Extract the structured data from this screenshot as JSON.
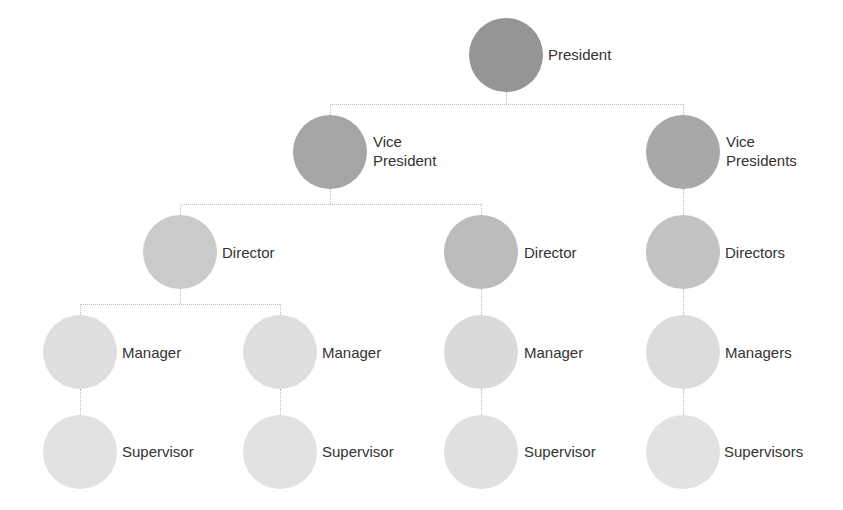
{
  "diagram": {
    "type": "org-chart",
    "colors": {
      "level_1": "#959595",
      "level_2": "#a8a8a8",
      "level_3": "#c9c9c9",
      "level_3_alt": "#bababa",
      "level_4": "#dcdcdc",
      "level_5": "#e2e2e2",
      "connector": "#bdbdbd",
      "text": "#333333"
    },
    "nodes": {
      "president": {
        "label": "President"
      },
      "vp_left": {
        "label": "Vice\nPresident"
      },
      "vp_right": {
        "label": "Vice\nPresidents"
      },
      "director_left": {
        "label": "Director"
      },
      "director_middle": {
        "label": "Director"
      },
      "directors_right": {
        "label": "Directors"
      },
      "manager_1": {
        "label": "Manager"
      },
      "manager_2": {
        "label": "Manager"
      },
      "manager_3": {
        "label": "Manager"
      },
      "managers_right": {
        "label": "Managers"
      },
      "supervisor_1": {
        "label": "Supervisor"
      },
      "supervisor_2": {
        "label": "Supervisor"
      },
      "supervisor_3": {
        "label": "Supervisor"
      },
      "supervisors_right": {
        "label": "Supervisors"
      }
    },
    "edges": [
      [
        "President",
        "Vice President"
      ],
      [
        "President",
        "Vice Presidents"
      ],
      [
        "Vice President",
        "Director (left)"
      ],
      [
        "Vice President",
        "Director (middle)"
      ],
      [
        "Vice Presidents",
        "Directors"
      ],
      [
        "Director (left)",
        "Manager 1"
      ],
      [
        "Director (left)",
        "Manager 2"
      ],
      [
        "Director (middle)",
        "Manager 3"
      ],
      [
        "Directors",
        "Managers"
      ],
      [
        "Manager 1",
        "Supervisor 1"
      ],
      [
        "Manager 2",
        "Supervisor 2"
      ],
      [
        "Manager 3",
        "Supervisor 3"
      ],
      [
        "Managers",
        "Supervisors"
      ]
    ]
  }
}
